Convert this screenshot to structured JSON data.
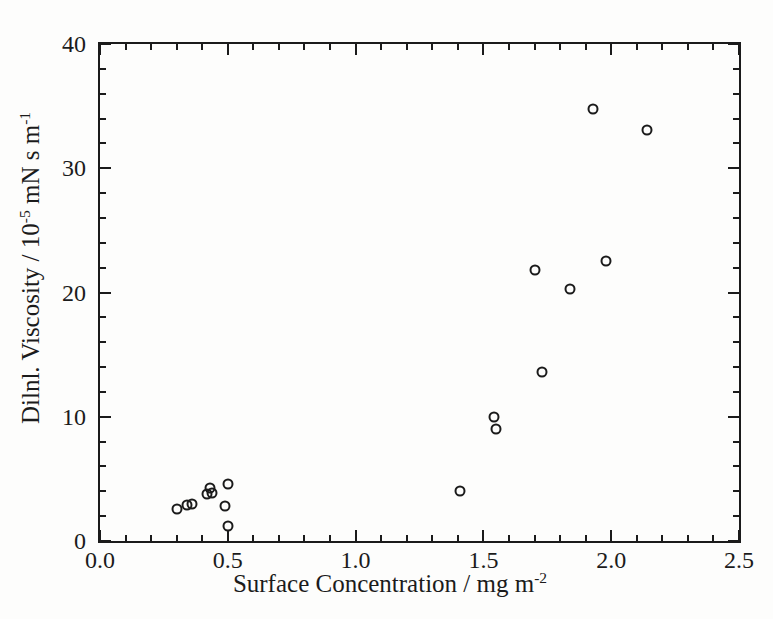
{
  "figure": {
    "background": "#fdfdfc",
    "ink_color": "#1b1b1b"
  },
  "chart_data": {
    "type": "scatter",
    "title": "",
    "xlabel": "Surface Concentration / mg m^-2",
    "ylabel": "Dilnl. Viscosity / 10^-5 mN s m^-1",
    "xlabel_parts": [
      {
        "text": "Surface Concentration / mg m",
        "sup": false
      },
      {
        "text": "-2",
        "sup": true
      }
    ],
    "ylabel_parts": [
      {
        "text": "Dilnl. Viscosity / 10",
        "sup": false
      },
      {
        "text": "-5",
        "sup": true
      },
      {
        "text": " mN s m",
        "sup": false
      },
      {
        "text": "-1",
        "sup": true
      }
    ],
    "xlim": [
      0,
      2.5
    ],
    "ylim": [
      0,
      40
    ],
    "x_major_ticks": [
      {
        "value": 0.0,
        "label": "0.0"
      },
      {
        "value": 0.5,
        "label": "0.5"
      },
      {
        "value": 1.0,
        "label": "1.0"
      },
      {
        "value": 1.5,
        "label": "1.5"
      },
      {
        "value": 2.0,
        "label": "2.0"
      },
      {
        "value": 2.5,
        "label": "2.5"
      }
    ],
    "x_minor_step": 0.1,
    "y_major_ticks": [
      {
        "value": 0,
        "label": "0"
      },
      {
        "value": 10,
        "label": "10"
      },
      {
        "value": 20,
        "label": "20"
      },
      {
        "value": 30,
        "label": "30"
      },
      {
        "value": 40,
        "label": "40"
      }
    ],
    "y_minor_step": 2,
    "grid": false,
    "legend": null,
    "marker": {
      "shape": "open-circle",
      "diameter_px": 11
    },
    "points": [
      {
        "x": 0.3,
        "y": 2.6
      },
      {
        "x": 0.34,
        "y": 2.9
      },
      {
        "x": 0.36,
        "y": 3.0
      },
      {
        "x": 0.42,
        "y": 3.8
      },
      {
        "x": 0.44,
        "y": 3.9
      },
      {
        "x": 0.43,
        "y": 4.3
      },
      {
        "x": 0.5,
        "y": 4.6
      },
      {
        "x": 0.49,
        "y": 2.8
      },
      {
        "x": 0.5,
        "y": 1.2
      },
      {
        "x": 1.41,
        "y": 4.0
      },
      {
        "x": 1.54,
        "y": 10.0
      },
      {
        "x": 1.55,
        "y": 9.0
      },
      {
        "x": 1.73,
        "y": 13.6
      },
      {
        "x": 1.7,
        "y": 21.8
      },
      {
        "x": 1.84,
        "y": 20.3
      },
      {
        "x": 1.98,
        "y": 22.5
      },
      {
        "x": 1.93,
        "y": 34.8
      },
      {
        "x": 2.14,
        "y": 33.1
      }
    ]
  }
}
